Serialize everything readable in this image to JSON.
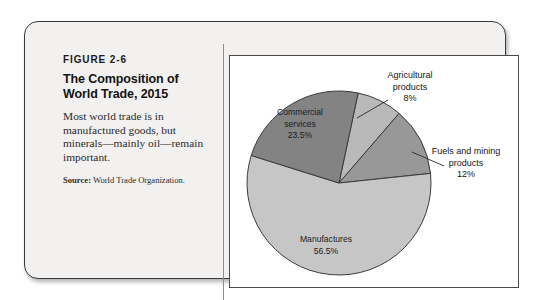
{
  "figure": {
    "number": "FIGURE 2-6",
    "title_line1": "The Composition of",
    "title_line2": "World Trade, 2015",
    "description": "Most world trade is in manufactured goods, but minerals—mainly oil—remain important.",
    "source_label": "Source:",
    "source_text": " World Trade Organization."
  },
  "chart_data": {
    "type": "pie",
    "title": "The Composition of World Trade, 2015",
    "subtitle": "",
    "xlabel": "",
    "ylabel": "",
    "legend_position": "none",
    "grid": false,
    "unit": "%",
    "total": 100,
    "start_angle_deg": 12,
    "direction": "clockwise",
    "categories": [
      "Agricultural products",
      "Fuels and mining products",
      "Manufactures",
      "Commercial services"
    ],
    "values": [
      8,
      12,
      56.5,
      23.5
    ],
    "slices": [
      {
        "name": "Agricultural products",
        "label_line1": "Agricultural",
        "label_line2": "products",
        "value": 8,
        "value_text": "8%",
        "color": "#b9b9b9",
        "label_placement": "outside",
        "has_leader": true
      },
      {
        "name": "Fuels and mining products",
        "label_line1": "Fuels and mining",
        "label_line2": "products",
        "value": 12,
        "value_text": "12%",
        "color": "#989898",
        "label_placement": "outside",
        "has_leader": true
      },
      {
        "name": "Manufactures",
        "label_line1": "Manufactures",
        "label_line2": "",
        "value": 56.5,
        "value_text": "56.5%",
        "color": "#c6c6c6",
        "label_placement": "inside",
        "has_leader": false
      },
      {
        "name": "Commercial services",
        "label_line1": "Commercial",
        "label_line2": "services",
        "value": 23.5,
        "value_text": "23.5%",
        "color": "#838383",
        "label_placement": "inside",
        "has_leader": false
      }
    ],
    "geometry": {
      "center_x": 109,
      "center_y": 127,
      "radius": 92
    }
  },
  "colors": {
    "frame_border": "#3a3a3a",
    "frame_fill": "#f2f1ef",
    "panel_fill": "#ffffff",
    "panel_border": "#4a4a4a",
    "text": "#1b1b1b",
    "slice_stroke": "#3b3b3b"
  }
}
